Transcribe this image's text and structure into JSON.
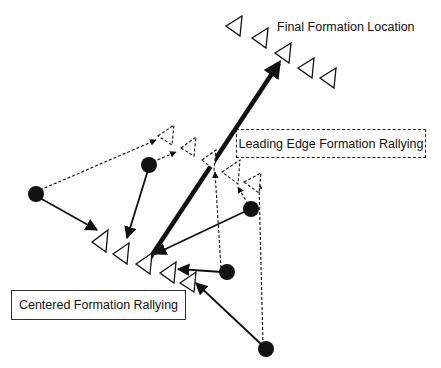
{
  "diagram": {
    "labels": {
      "final_formation": "Final Formation Location",
      "leading_edge": "Leading Edge Formation Rallying",
      "centered": "Centered Formation Rallying"
    },
    "colors": {
      "ink": "#111111",
      "background": "#ffffff"
    },
    "units": [
      {
        "id": 1,
        "position": [
          36,
          194
        ]
      },
      {
        "id": 2,
        "position": [
          149,
          165
        ]
      },
      {
        "id": 3,
        "position": [
          251,
          209
        ]
      },
      {
        "id": 4,
        "position": [
          227,
          272
        ]
      },
      {
        "id": 5,
        "position": [
          266,
          349
        ]
      }
    ],
    "final_formation_slots": [
      [
        236,
        26
      ],
      [
        262,
        37
      ],
      [
        285,
        51
      ],
      [
        308,
        67
      ],
      [
        330,
        76
      ]
    ],
    "centered_formation_slots": [
      [
        100,
        240
      ],
      [
        122,
        252
      ],
      [
        145,
        262
      ],
      [
        170,
        272
      ],
      [
        190,
        281
      ]
    ],
    "leading_edge_slots": [
      [
        168,
        131
      ],
      [
        188,
        141
      ],
      [
        205,
        148
      ],
      [
        235,
        167
      ],
      [
        256,
        175
      ]
    ],
    "legend": {
      "solid_arrow": "Centered Formation Rallying path",
      "dashed_arrow": "Leading Edge Formation Rallying path",
      "bold_arrow": "Movement to Final Formation Location"
    }
  }
}
